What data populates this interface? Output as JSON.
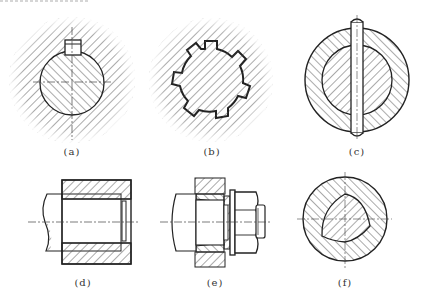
{
  "figures": [
    {
      "id": "a",
      "label": "(a)",
      "description": "flat key connection"
    },
    {
      "id": "b",
      "label": "(b)",
      "description": "spline connection"
    },
    {
      "id": "c",
      "label": "(c)",
      "description": "pin connection"
    },
    {
      "id": "d",
      "label": "(d)",
      "description": "interference fit connection"
    },
    {
      "id": "e",
      "label": "(e)",
      "description": "expansion sleeve connection with nut"
    },
    {
      "id": "f",
      "label": "(f)",
      "description": "profile (polygon) connection"
    }
  ],
  "colors": {
    "line": "#222222",
    "hatch": "#555555",
    "background": "#ffffff"
  }
}
